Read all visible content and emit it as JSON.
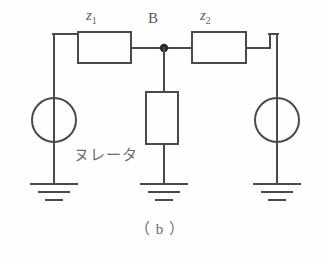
{
  "figure": {
    "caption": "（ b ）",
    "background_color": "#fefefe",
    "line_color": "#4a4a4a",
    "text_color": "#6b6b6b"
  },
  "labels": {
    "impedance_left": {
      "symbol": "z",
      "subscript": "1"
    },
    "impedance_right": {
      "symbol": "z",
      "subscript": "2"
    },
    "node_b": "B",
    "nullator": "ヌレータ"
  },
  "components": [
    {
      "name": "impedance-z1",
      "type": "box",
      "orientation": "horizontal"
    },
    {
      "name": "impedance-z2",
      "type": "box",
      "orientation": "horizontal"
    },
    {
      "name": "nullator",
      "type": "box",
      "orientation": "vertical"
    },
    {
      "name": "source-left",
      "type": "circle-source"
    },
    {
      "name": "source-right",
      "type": "circle-source"
    },
    {
      "name": "ground-left",
      "type": "ground"
    },
    {
      "name": "ground-middle",
      "type": "ground"
    },
    {
      "name": "ground-right",
      "type": "ground"
    },
    {
      "name": "node-dot-b",
      "type": "junction"
    }
  ]
}
